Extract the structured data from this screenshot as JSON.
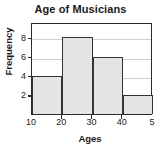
{
  "chart_data": {
    "type": "bar",
    "title": "Age of Musicians",
    "xlabel": "Ages",
    "ylabel": "Frequency",
    "categories": [
      "10-20",
      "20-30",
      "30-40",
      "40-50"
    ],
    "values": [
      4,
      8,
      6,
      2
    ],
    "bin_edges": [
      10,
      20,
      30,
      40,
      50
    ],
    "x_tick_labels": [
      "10",
      "20",
      "30",
      "40",
      "5"
    ],
    "x_tick_values": [
      10,
      20,
      30,
      40,
      50
    ],
    "y_tick_labels": [
      "2",
      "4",
      "6",
      "8"
    ],
    "y_tick_values": [
      2,
      4,
      6,
      8
    ],
    "xlim": [
      10,
      50
    ],
    "ylim": [
      0,
      9.6
    ],
    "grid": true,
    "legend": false,
    "colors": {
      "bar_fill": "#e4e4e4",
      "bar_edge": "#333333",
      "gridline": "#cfcfcf",
      "frame": "#2b2b2b",
      "text": "#1a1a1a",
      "background": "#ffffff"
    }
  }
}
